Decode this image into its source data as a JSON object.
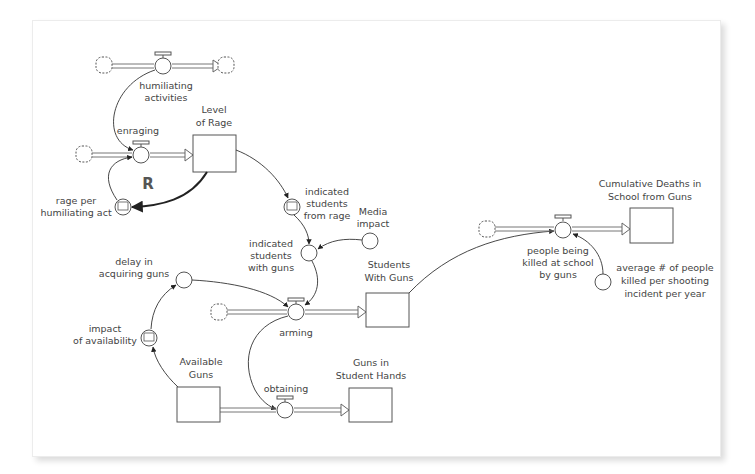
{
  "diagram": {
    "type": "stock-and-flow",
    "loop_label": "R",
    "stocks": {
      "level_of_rage": [
        "Level",
        "of Rage"
      ],
      "students_with_guns": [
        "Students",
        "With Guns"
      ],
      "available_guns": [
        "Available",
        "Guns"
      ],
      "guns_in_student_hands": [
        "Guns in",
        "Student Hands"
      ],
      "cumulative_deaths": [
        "Cumulative Deaths in",
        "School from Guns"
      ]
    },
    "flows": {
      "humiliating_activities": [
        "humiliating",
        "activities"
      ],
      "enraging": [
        "enraging"
      ],
      "arming": [
        "arming"
      ],
      "obtaining": [
        "obtaining"
      ],
      "people_killed": [
        "people being",
        "killed at school",
        "by guns"
      ]
    },
    "converters": {
      "rage_per_act": [
        "rage per",
        "humiliating act"
      ],
      "students_from_rage": [
        "indicated",
        "students",
        "from rage"
      ],
      "media_impact": [
        "Media",
        "impact"
      ],
      "students_with_guns_ind": [
        "indicated",
        "students",
        "with guns"
      ],
      "delay": [
        "delay in",
        "acquiring guns"
      ],
      "impact_availability": [
        "impact",
        "of availability"
      ],
      "avg_killed": [
        "average # of people",
        "killed per shooting",
        "incident per year"
      ]
    }
  }
}
